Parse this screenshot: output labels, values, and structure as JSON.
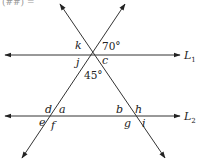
{
  "diagram": {
    "type": "parallel-lines-transversals",
    "top_clipped_text": "(##) =",
    "lines": {
      "L1": {
        "label": "L",
        "subscript": "1"
      },
      "L2": {
        "label": "L",
        "subscript": "2"
      }
    },
    "angles_at_top_intersection": {
      "k": "k",
      "given_upper_right": "70°",
      "j": "j",
      "c": "c",
      "given_below": "45°"
    },
    "angles_at_left_intersection": {
      "d": "d",
      "a": "a",
      "e": "e",
      "f": "f"
    },
    "angles_at_right_intersection": {
      "b": "b",
      "h": "h",
      "g": "g",
      "i": "i"
    },
    "colors": {
      "stroke": "#333333",
      "text": "#222222",
      "background": "#ffffff"
    }
  }
}
